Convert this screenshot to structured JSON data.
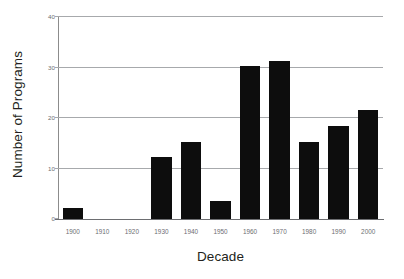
{
  "chart_data": {
    "type": "bar",
    "title": "",
    "xlabel": "Decade",
    "ylabel": "Number of Programs",
    "categories": [
      "1900",
      "1910",
      "1920",
      "1930",
      "1940",
      "1950",
      "1960",
      "1970",
      "1980",
      "1990",
      "2000"
    ],
    "values": [
      2.2,
      0,
      0,
      12.2,
      15.2,
      3.5,
      30.3,
      31.3,
      15.3,
      18.5,
      21.5
    ],
    "ylim": [
      0,
      40
    ],
    "ytick_labels": [
      "0",
      "10",
      "20",
      "30",
      "40"
    ],
    "ytick_values": [
      0,
      10,
      20,
      30,
      40
    ],
    "grid": true,
    "grid_axis": "y",
    "legend": false,
    "legend_position": "none",
    "bar_color": "#0d0d0d",
    "grid_color": "#a7a9ac",
    "axis_color": "#6d6e71",
    "label_color": "#231f20",
    "background": "#ffffff"
  }
}
